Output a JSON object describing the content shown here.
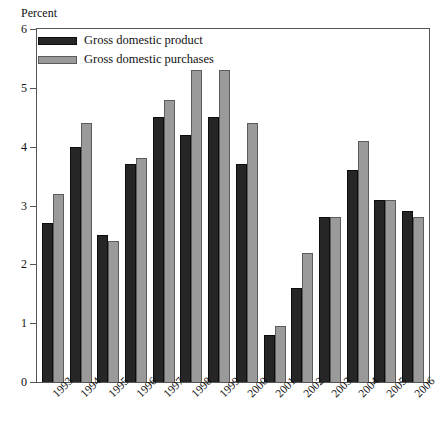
{
  "chart_data": {
    "type": "bar",
    "title": "",
    "subtitle": "",
    "xlabel": "",
    "ylabel": "Percent",
    "ylim": [
      0,
      6
    ],
    "yticks": [
      0,
      1,
      2,
      3,
      4,
      5,
      6
    ],
    "ytick_labels": [
      "0",
      "1",
      "2",
      "3",
      "4",
      "5",
      "6"
    ],
    "grid": false,
    "legend_position": "top-left",
    "categories": [
      "1993",
      "1994",
      "1995",
      "1996",
      "1997",
      "1998",
      "1999",
      "2000",
      "2001",
      "2002",
      "2003",
      "2004",
      "2005",
      "2006"
    ],
    "series": [
      {
        "name": "Gross domestic product",
        "color": "#262626",
        "values": [
          2.7,
          4.0,
          2.5,
          3.7,
          4.5,
          4.2,
          4.5,
          3.7,
          0.8,
          1.6,
          2.8,
          3.6,
          3.1,
          2.9
        ]
      },
      {
        "name": "Gross domestic purchases",
        "color": "#9a9a9a",
        "values": [
          3.2,
          4.4,
          2.4,
          3.8,
          4.8,
          5.3,
          5.3,
          4.4,
          0.95,
          2.2,
          2.8,
          4.1,
          3.1,
          2.8
        ]
      }
    ]
  },
  "legend": {
    "items": [
      {
        "label": "Gross domestic product",
        "swatch": "gdp"
      },
      {
        "label": "Gross domestic purchases",
        "swatch": "purch"
      }
    ]
  },
  "axis": {
    "y_title": "Percent"
  }
}
